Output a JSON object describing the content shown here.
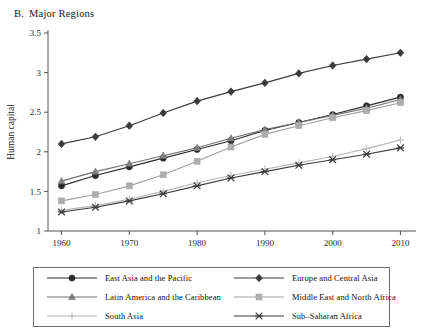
{
  "panel": {
    "letter": "B.",
    "title": "Major Regions"
  },
  "chart_data": {
    "type": "line",
    "xlabel": "Year",
    "ylabel": "Human capital",
    "xlim": [
      1958,
      2012
    ],
    "ylim": [
      1,
      3.5
    ],
    "xticks": [
      1960,
      1970,
      1980,
      1990,
      2000,
      2010
    ],
    "yticks": [
      "1",
      "1.5",
      "2",
      "2.5",
      "3",
      "3.5"
    ],
    "ytick_values": [
      1,
      1.5,
      2,
      2.5,
      3,
      3.5
    ],
    "grid": false,
    "legend_position": "below",
    "x": [
      1960,
      1965,
      1970,
      1975,
      1980,
      1985,
      1990,
      1995,
      2000,
      2005,
      2010
    ],
    "series": [
      {
        "name": "East Asia and the Pacific",
        "marker": "circle",
        "color": "#2b2b2b",
        "line_color": "#2b2b2b",
        "values": [
          1.57,
          1.7,
          1.81,
          1.92,
          2.03,
          2.14,
          2.27,
          2.37,
          2.47,
          2.58,
          2.69
        ]
      },
      {
        "name": "Europe and Central Asia",
        "marker": "diamond",
        "color": "#3a3a3a",
        "line_color": "#3a3a3a",
        "values": [
          2.1,
          2.19,
          2.33,
          2.49,
          2.64,
          2.76,
          2.87,
          2.99,
          3.09,
          3.17,
          3.25
        ]
      },
      {
        "name": "Latin America and the Caribbean",
        "marker": "triangle",
        "color": "#808080",
        "line_color": "#707070",
        "values": [
          1.63,
          1.75,
          1.85,
          1.95,
          2.05,
          2.17,
          2.28,
          2.37,
          2.46,
          2.55,
          2.66
        ]
      },
      {
        "name": "Middle East and North Africa",
        "marker": "square",
        "color": "#adadad",
        "line_color": "#a0a0a0",
        "values": [
          1.38,
          1.46,
          1.57,
          1.71,
          1.88,
          2.06,
          2.22,
          2.33,
          2.43,
          2.52,
          2.62
        ]
      },
      {
        "name": "South Asia",
        "marker": "plus",
        "color": "#bdbdbd",
        "line_color": "#b5b5b5",
        "values": [
          1.26,
          1.32,
          1.4,
          1.5,
          1.61,
          1.7,
          1.78,
          1.86,
          1.94,
          2.04,
          2.15
        ]
      },
      {
        "name": "Sub–Saharan Africa",
        "marker": "cross",
        "color": "#3a3a3a",
        "line_color": "#3a3a3a",
        "values": [
          1.24,
          1.3,
          1.38,
          1.47,
          1.57,
          1.67,
          1.75,
          1.83,
          1.9,
          1.97,
          2.05
        ]
      }
    ]
  },
  "legend": {
    "items": [
      {
        "label": "East Asia and the Pacific"
      },
      {
        "label": "Europe and Central Asia"
      },
      {
        "label": "Latin America and the Caribbean"
      },
      {
        "label": "Middle East and North Africa"
      },
      {
        "label": "South Asia"
      },
      {
        "label": "Sub–Saharan Africa"
      }
    ]
  }
}
